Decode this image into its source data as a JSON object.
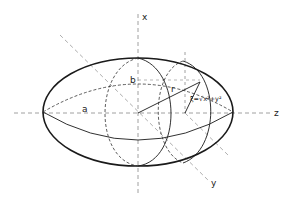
{
  "diagram": {
    "type": "prolate ellipsoid geometry",
    "labels": {
      "axis_x": "x",
      "axis_y": "y",
      "axis_z": "z",
      "semi_axis_a": "a",
      "semi_axis_b": "b",
      "radius": "r",
      "formula": "ξ=√x²+y²"
    },
    "colors": {
      "outline": "#1a1a1a",
      "dashed": "#444444",
      "axis": "#888888"
    }
  }
}
